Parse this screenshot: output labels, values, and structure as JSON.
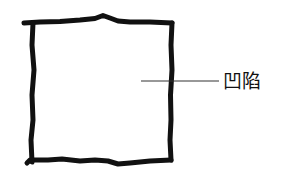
{
  "diagram": {
    "shape": "hand-drawn-square",
    "stroke_color": "#111111",
    "leader_line_color": "#333333",
    "annotations": [
      {
        "label": "凹陷",
        "target": "square-interior"
      }
    ]
  }
}
